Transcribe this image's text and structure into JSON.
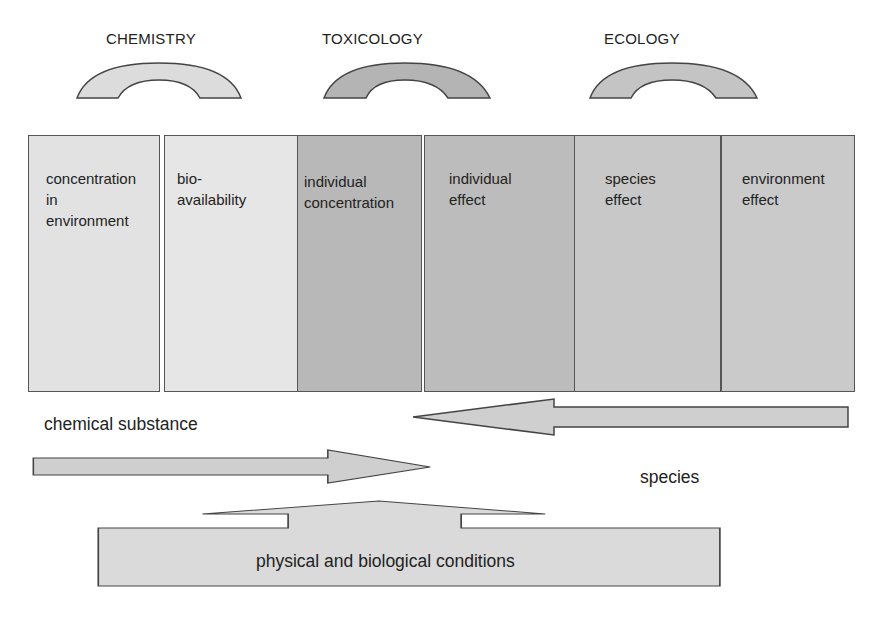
{
  "diagram": {
    "headings": [
      {
        "label": "CHEMISTRY",
        "x": 106
      },
      {
        "label": "TOXICOLOGY",
        "x": 322
      },
      {
        "label": "ECOLOGY",
        "x": 604
      }
    ],
    "arcs": [
      {
        "name": "chemistry-arc",
        "cx": 159,
        "fill": "#dcdcdc"
      },
      {
        "name": "toxicology-arc",
        "cx": 385,
        "fill": "#b4b4b4"
      },
      {
        "name": "ecology-arc",
        "cx": 673,
        "fill": "#c4c4c4"
      }
    ],
    "columns": [
      {
        "label": "concentration\nin\nenvironment",
        "x": 28,
        "w": 132,
        "fill": "#e2e2e2"
      },
      {
        "label": "bio-\navailability",
        "x": 164,
        "w": 134,
        "fill": "#e6e6e6"
      },
      {
        "label": "individual\nconcentration",
        "x": 297,
        "w": 125,
        "fill": "#b8b8b8"
      },
      {
        "label": "individual\neffect",
        "x": 424,
        "w": 151,
        "fill": "#bcbcbc"
      },
      {
        "label": "species\neffect",
        "x": 575,
        "w": 146,
        "fill": "#c8c8c8"
      },
      {
        "label": "environment\neffect",
        "x": 721,
        "w": 134,
        "fill": "#cacaca"
      }
    ],
    "flows": {
      "chemical_substance": "chemical substance",
      "species": "species",
      "conditions": "physical and biological conditions"
    },
    "colors": {
      "stroke": "#444444",
      "arrow_fill": "#cfcfcf",
      "conditions_fill": "#dadada"
    }
  }
}
